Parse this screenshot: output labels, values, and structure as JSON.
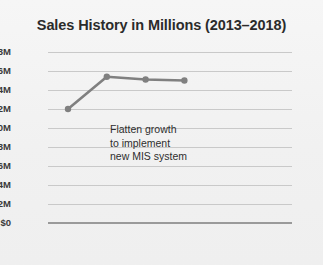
{
  "chart_data": {
    "type": "line",
    "title": "Sales History in Millions (2013–2018)",
    "xlabel": "",
    "ylabel": "",
    "categories": [
      "2013",
      "14",
      "15",
      "16",
      "17",
      "18"
    ],
    "x": [
      2013,
      2014,
      2015,
      2016,
      2017,
      2018
    ],
    "values": [
      12.0,
      15.4,
      15.1,
      15.0,
      null,
      null
    ],
    "series": [
      {
        "name": "Sales",
        "values": [
          12.0,
          15.4,
          15.1,
          15.0,
          null,
          null
        ],
        "color": "#808080",
        "marker": "circle"
      }
    ],
    "ylim": [
      0,
      18
    ],
    "ytick_values": [
      18,
      16,
      14,
      12,
      10,
      8,
      6,
      4,
      2,
      0
    ],
    "ytick_labels": [
      "$18M",
      "$16M",
      "$14M",
      "$12M",
      "$10M",
      "$8M",
      "$6M",
      "$4M",
      "$2M",
      "$0"
    ],
    "xtick_labels": [
      "2013",
      "14",
      "15",
      "16",
      "17",
      "18"
    ],
    "grid": true,
    "legend": false,
    "legend_position": "none",
    "annotations": [
      {
        "name": "flatten-growth-note",
        "lines": [
          "Flatten growth",
          "to implement",
          "new MIS system"
        ]
      }
    ]
  },
  "colors": {
    "background": "#f1f1f1",
    "title": "#2b2b2b",
    "gridline": "#c9c9c9",
    "axis": "#9a9a9a",
    "series": "#808080",
    "tick_label": "#3a3a3a",
    "annotation": "#2e2e2e"
  }
}
